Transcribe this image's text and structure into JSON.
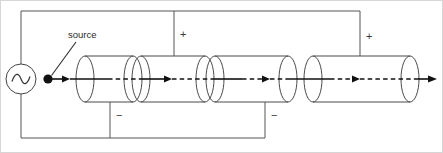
{
  "figure": {
    "background_color": "#ffffff",
    "width": 443,
    "height": 153,
    "border_color": "#d6d6d6"
  },
  "labels": {
    "source": "source",
    "plus_1": "+",
    "plus_2": "+",
    "minus_1": "−",
    "minus_2": "−"
  },
  "colors": {
    "wire": "#555555",
    "tube": "#4a4a4a",
    "axis": "#111111",
    "text": "#2b2b2b",
    "sign": "#3a3a3a"
  },
  "components": {
    "source_symbol": "ac-source-sine",
    "node_marker": "filled-dot",
    "cylinders": [
      {
        "name": "cylinder-1",
        "left": 85,
        "right": 133,
        "cap_rx": 9,
        "cap_ry": 23
      },
      {
        "name": "cylinder-2",
        "left": 141,
        "right": 205,
        "cap_rx": 9,
        "cap_ry": 23
      },
      {
        "name": "cylinder-3",
        "left": 215,
        "right": 288,
        "cap_rx": 9,
        "cap_ry": 23
      },
      {
        "name": "cylinder-4",
        "left": 313,
        "right": 410,
        "cap_rx": 9,
        "cap_ry": 23
      }
    ]
  },
  "wiring": {
    "top_rail_y": 11,
    "bottom_rail_y": 138,
    "left_rail_x": 21,
    "axis_y": 79,
    "top_taps_x": [
      174,
      360
    ],
    "bottom_taps_x": [
      110,
      265
    ]
  }
}
